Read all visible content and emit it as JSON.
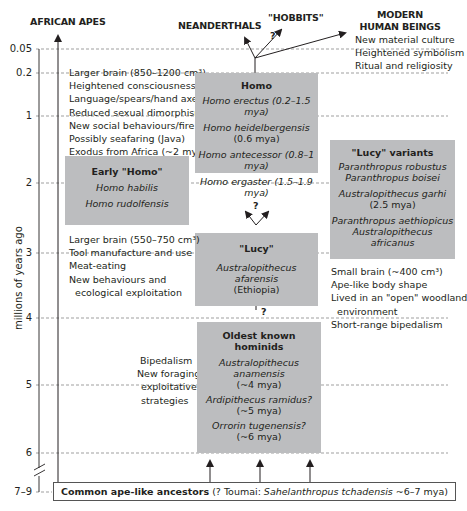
{
  "axis": {
    "ylabel": "millions of years ago",
    "ticks": [
      {
        "label": "0.05",
        "y": 49
      },
      {
        "label": "0.2",
        "y": 73
      },
      {
        "label": "1",
        "y": 116
      },
      {
        "label": "2",
        "y": 183
      },
      {
        "label": "3",
        "y": 253
      },
      {
        "label": "4",
        "y": 318
      },
      {
        "label": "5",
        "y": 385
      },
      {
        "label": "6",
        "y": 453
      },
      {
        "label": "7–9",
        "y": 492
      }
    ]
  },
  "headers": {
    "african_apes": "AFRICAN APES",
    "neanderthals": "NEANDERTHALS",
    "hobbits": "\"HOBBITS\"",
    "modern_line1": "MODERN",
    "modern_line2": "HUMAN BEINGS",
    "question": "?"
  },
  "notes": {
    "modern": [
      "New material culture",
      "Heightened symbolism",
      "Ritual and religiosity"
    ],
    "homo_traits": [
      "Larger brain (850–1200 cm³)",
      "Heightened consciousness",
      "Language/spears/hand axes",
      "Reduced sexual dimorphism",
      "New social behaviours/fire use",
      "Possibly seafaring (Java)",
      "Exodus from Africa (~2 mya)"
    ],
    "early_homo_traits": [
      "Larger brain (550–750 cm³)",
      "Tool manufacture and use",
      "Meat-eating",
      "New behaviours and",
      "  ecological exploitation"
    ],
    "lucy_traits": [
      "Small brain (~400 cm³)",
      "Ape-like body shape",
      "Lived in an \"open\" woodland",
      "  environment",
      "Short-range bipedalism"
    ],
    "oldest_traits": [
      "Bipedalism",
      "New foraging",
      "exploitative",
      "strategies"
    ]
  },
  "boxes": {
    "homo": {
      "title": "Homo",
      "species": [
        "Homo erectus (0.2–1.5 mya)",
        "Homo heidelbergensis",
        "(0.6 mya)",
        "Homo antecessor (0.8–1 mya)",
        "Homo ergaster (1.5–1.9 mya)"
      ]
    },
    "early_homo": {
      "title": "Early \"Homo\"",
      "species": [
        "Homo habilis",
        "Homo rudolfensis"
      ]
    },
    "lucy_variants": {
      "title": "\"Lucy\" variants",
      "species": [
        "Paranthropus robustus",
        "Paranthropus boisei",
        "Australopithecus garhi",
        "(2.5 mya)",
        "Paranthropus aethiopicus",
        "Australopithecus africanus"
      ]
    },
    "lucy": {
      "title": "\"Lucy\"",
      "species": [
        "Australopithecus afarensis",
        "(Ethiopia)"
      ]
    },
    "oldest": {
      "title": "Oldest known hominids",
      "species": [
        "Australopithecus anamensis",
        "(~4 mya)",
        "Ardipithecus ramidus?",
        "(~5 mya)",
        "Orrorin tugenensis?",
        "(~6 mya)"
      ]
    }
  },
  "ancestors": {
    "bold": "Common ape-like ancestors",
    "plain": " (? Toumai: ",
    "italic": "Sahelanthropus tchadensis",
    "end": " ~6–7 mya)"
  }
}
